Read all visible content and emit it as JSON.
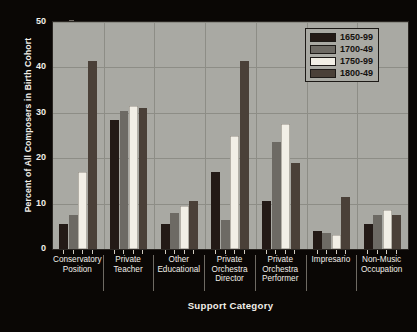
{
  "chart_data": {
    "type": "bar",
    "title": "",
    "xlabel": "Support Category",
    "ylabel": "Percent of All Composers in Birth Cohort",
    "ylim": [
      0,
      50
    ],
    "ytick_values": [
      0,
      10,
      20,
      30,
      40,
      50
    ],
    "ytick_labels": [
      "0",
      "10",
      "20",
      "30",
      "40",
      "50"
    ],
    "yminor_values": [
      5,
      15,
      25,
      35,
      45
    ],
    "grid": true,
    "legend_position": "top-right",
    "categories": [
      "Conservatory Position",
      "Private Teacher",
      "Other Educational",
      "Private Orchestra Director",
      "Private Orchestra Performer",
      "Impresario",
      "Non-Music Occupation"
    ],
    "category_lines": [
      [
        "Conservatory",
        "Position"
      ],
      [
        "Private",
        "Teacher"
      ],
      [
        "Other",
        "Educational"
      ],
      [
        "Private",
        "Orchestra",
        "Director"
      ],
      [
        "Private",
        "Orchestra",
        "Performer"
      ],
      [
        "Impresario"
      ],
      [
        "Non-Music",
        "Occupation"
      ]
    ],
    "series": [
      {
        "name": "1650-99",
        "color": "#231a16",
        "values": [
          5.5,
          28.5,
          5.5,
          17,
          10.5,
          4,
          5.5
        ]
      },
      {
        "name": "1700-49",
        "color": "#6d6a64",
        "values": [
          7.5,
          30.5,
          8,
          6.5,
          23.5,
          3.5,
          7.5
        ]
      },
      {
        "name": "1750-99",
        "color": "#f2efe6",
        "values": [
          17,
          31.5,
          9.5,
          25,
          27.5,
          3,
          8.5
        ]
      },
      {
        "name": "1800-49",
        "color": "#4a4038",
        "values": [
          41.5,
          31,
          10.5,
          41.5,
          19,
          11.5,
          7.5
        ]
      }
    ]
  },
  "legend": {
    "entries": [
      "1650-99",
      "1700-49",
      "1750-99",
      "1800-49"
    ]
  },
  "colors": {
    "plot_background": "#a9a9a3",
    "figure_background": "#0a0705",
    "gridline": "#8d8d86",
    "axis_text": "#f2efe9",
    "legend_text": "#14110e"
  }
}
